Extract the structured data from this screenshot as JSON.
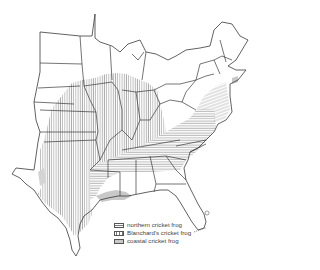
{
  "map": {
    "title": "",
    "region": "Eastern United States",
    "legend": [
      {
        "label": "northern cricket frog",
        "pattern": "horizontal-hatch",
        "color": "#777777"
      },
      {
        "label": "Blanchard's cricket frog",
        "pattern": "vertical-hatch",
        "color": "#777777"
      },
      {
        "label": "coastal cricket frog",
        "pattern": "solid-fill",
        "color": "#c8c8c8"
      }
    ]
  }
}
